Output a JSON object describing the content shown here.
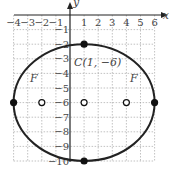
{
  "chart_data": {
    "type": "scatter",
    "title": "",
    "xlabel": "x",
    "ylabel": "y",
    "xlim": [
      -4,
      6
    ],
    "ylim": [
      -10,
      0
    ],
    "grid": true,
    "x_ticks": [
      "−4",
      "−3",
      "−2",
      "−1",
      "1",
      "2",
      "3",
      "4",
      "5",
      "6"
    ],
    "y_ticks": [
      "−1",
      "−2",
      "−3",
      "−4",
      "−5",
      "−6",
      "−7",
      "−8",
      "−9",
      "−10"
    ],
    "ellipse": {
      "center": [
        1,
        -6
      ],
      "rx": 5,
      "ry": 4
    },
    "points": [
      {
        "x": 1,
        "y": -2,
        "filled": true
      },
      {
        "x": 1,
        "y": -10,
        "filled": true
      },
      {
        "x": -4,
        "y": -6,
        "filled": true
      },
      {
        "x": 6,
        "y": -6,
        "filled": true
      },
      {
        "x": 1,
        "y": -6,
        "filled": false,
        "label": "C(1, −6)"
      },
      {
        "x": -2,
        "y": -6,
        "filled": false,
        "label": "F"
      },
      {
        "x": 4,
        "y": -6,
        "filled": false,
        "label": "F"
      }
    ],
    "annotations": [
      "C(1, −6)",
      "F",
      "F"
    ]
  }
}
